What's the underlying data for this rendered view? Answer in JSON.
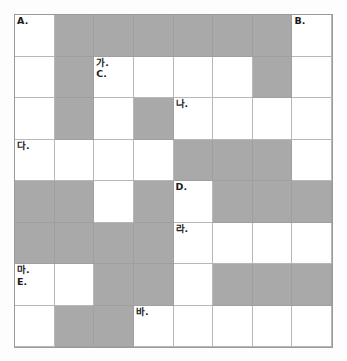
{
  "puzzle": {
    "title": "",
    "columns": 8,
    "rows": 8,
    "colors": {
      "block": "#a9a9a9",
      "open": "#ffffff",
      "grid_line": "#b7b7b7",
      "border": "#9a9a9a",
      "label_text": "#1a1a1a",
      "page_background": "#fdfdfd"
    },
    "grid": [
      [
        {
          "type": "open",
          "labels": [
            "A."
          ]
        },
        {
          "type": "block",
          "labels": []
        },
        {
          "type": "block",
          "labels": []
        },
        {
          "type": "block",
          "labels": []
        },
        {
          "type": "block",
          "labels": []
        },
        {
          "type": "block",
          "labels": []
        },
        {
          "type": "block",
          "labels": []
        },
        {
          "type": "open",
          "labels": [
            "B."
          ]
        }
      ],
      [
        {
          "type": "open",
          "labels": []
        },
        {
          "type": "block",
          "labels": []
        },
        {
          "type": "open",
          "labels": [
            "가.",
            "C."
          ]
        },
        {
          "type": "open",
          "labels": []
        },
        {
          "type": "open",
          "labels": []
        },
        {
          "type": "open",
          "labels": []
        },
        {
          "type": "block",
          "labels": []
        },
        {
          "type": "open",
          "labels": []
        }
      ],
      [
        {
          "type": "open",
          "labels": []
        },
        {
          "type": "block",
          "labels": []
        },
        {
          "type": "open",
          "labels": []
        },
        {
          "type": "block",
          "labels": []
        },
        {
          "type": "open",
          "labels": [
            "나."
          ]
        },
        {
          "type": "open",
          "labels": []
        },
        {
          "type": "open",
          "labels": []
        },
        {
          "type": "open",
          "labels": []
        }
      ],
      [
        {
          "type": "open",
          "labels": [
            "다."
          ]
        },
        {
          "type": "open",
          "labels": []
        },
        {
          "type": "open",
          "labels": []
        },
        {
          "type": "open",
          "labels": []
        },
        {
          "type": "block",
          "labels": []
        },
        {
          "type": "block",
          "labels": []
        },
        {
          "type": "block",
          "labels": []
        },
        {
          "type": "open",
          "labels": []
        }
      ],
      [
        {
          "type": "block",
          "labels": []
        },
        {
          "type": "block",
          "labels": []
        },
        {
          "type": "open",
          "labels": []
        },
        {
          "type": "block",
          "labels": []
        },
        {
          "type": "open",
          "labels": [
            "D."
          ]
        },
        {
          "type": "block",
          "labels": []
        },
        {
          "type": "block",
          "labels": []
        },
        {
          "type": "block",
          "labels": []
        }
      ],
      [
        {
          "type": "block",
          "labels": []
        },
        {
          "type": "block",
          "labels": []
        },
        {
          "type": "block",
          "labels": []
        },
        {
          "type": "block",
          "labels": []
        },
        {
          "type": "open",
          "labels": [
            "라."
          ]
        },
        {
          "type": "open",
          "labels": []
        },
        {
          "type": "open",
          "labels": []
        },
        {
          "type": "open",
          "labels": []
        }
      ],
      [
        {
          "type": "open",
          "labels": [
            "마.",
            "E."
          ]
        },
        {
          "type": "open",
          "labels": []
        },
        {
          "type": "block",
          "labels": []
        },
        {
          "type": "block",
          "labels": []
        },
        {
          "type": "open",
          "labels": []
        },
        {
          "type": "block",
          "labels": []
        },
        {
          "type": "block",
          "labels": []
        },
        {
          "type": "block",
          "labels": []
        }
      ],
      [
        {
          "type": "open",
          "labels": []
        },
        {
          "type": "block",
          "labels": []
        },
        {
          "type": "block",
          "labels": []
        },
        {
          "type": "open",
          "labels": [
            "바."
          ]
        },
        {
          "type": "open",
          "labels": []
        },
        {
          "type": "open",
          "labels": []
        },
        {
          "type": "open",
          "labels": []
        },
        {
          "type": "open",
          "labels": []
        }
      ]
    ]
  }
}
